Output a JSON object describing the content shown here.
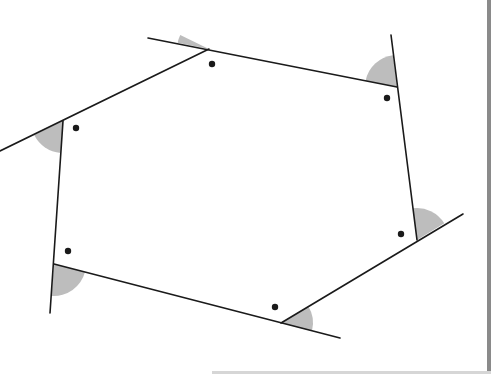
{
  "diagram": {
    "title": "",
    "colors": {
      "line": "#1a1a1a",
      "shade": "#bdbdbd",
      "dot": "#1a1a1a",
      "background": "#ffffff",
      "page_edge": "#8a8a8a"
    },
    "vertices": [
      {
        "id": "A",
        "x": 209,
        "y": 49
      },
      {
        "id": "B",
        "x": 397,
        "y": 87
      },
      {
        "id": "C",
        "x": 417,
        "y": 240
      },
      {
        "id": "D",
        "x": 281,
        "y": 323
      },
      {
        "id": "E",
        "x": 54,
        "y": 264
      },
      {
        "id": "F",
        "x": 63,
        "y": 121
      }
    ],
    "extended_lines": [
      {
        "from": [
          148,
          38
        ],
        "to": [
          397,
          87
        ]
      },
      {
        "from": [
          391,
          35
        ],
        "to": [
          417,
          240
        ]
      },
      {
        "from": [
          463,
          214
        ],
        "to": [
          281,
          323
        ]
      },
      {
        "from": [
          340,
          338
        ],
        "to": [
          54,
          264
        ]
      },
      {
        "from": [
          50,
          313
        ],
        "to": [
          63,
          121
        ]
      },
      {
        "from": [
          0,
          151
        ],
        "to": [
          209,
          49
        ]
      }
    ],
    "exterior_angles": [
      {
        "vertex": "A",
        "radius": 32,
        "start_deg": 191.1,
        "end_deg": 206.0
      },
      {
        "vertex": "B",
        "radius": 32,
        "start_deg": 191.4,
        "end_deg": 262.7
      },
      {
        "vertex": "C",
        "radius": 32,
        "start_deg": 262.6,
        "end_deg": 328.6
      },
      {
        "vertex": "D",
        "radius": 32,
        "start_deg": 328.6,
        "end_deg": 374.5
      },
      {
        "vertex": "E",
        "radius": 32,
        "start_deg": 14.5,
        "end_deg": 94.4
      },
      {
        "vertex": "F",
        "radius": 32,
        "start_deg": 94.4,
        "end_deg": 153.9
      }
    ],
    "interior_dots": [
      {
        "vertex": "A",
        "x": 212,
        "y": 64
      },
      {
        "vertex": "B",
        "x": 387,
        "y": 98
      },
      {
        "vertex": "C",
        "x": 401,
        "y": 234
      },
      {
        "vertex": "D",
        "x": 275,
        "y": 307
      },
      {
        "vertex": "E",
        "x": 68,
        "y": 251
      },
      {
        "vertex": "F",
        "x": 76,
        "y": 128
      }
    ]
  }
}
